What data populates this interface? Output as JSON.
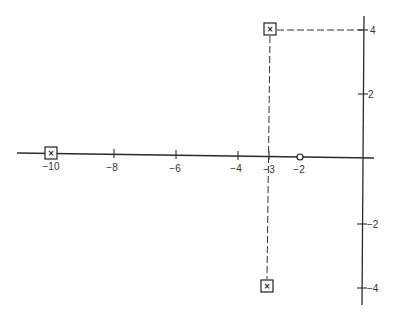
{
  "diagram": {
    "type": "pole-zero plot (s-plane)",
    "real_axis": {
      "ticks": [
        {
          "value": -10,
          "label": "−10"
        },
        {
          "value": -8,
          "label": "−8"
        },
        {
          "value": -6,
          "label": "−6"
        },
        {
          "value": -4,
          "label": "−4"
        },
        {
          "value": -3,
          "label": "−3"
        },
        {
          "value": -2,
          "label": "−2"
        }
      ]
    },
    "imag_axis": {
      "ticks": [
        {
          "value": 4,
          "label": "4"
        },
        {
          "value": 2,
          "label": "2"
        },
        {
          "value": -2,
          "label": "−2"
        },
        {
          "value": -4,
          "label": "−4"
        }
      ]
    },
    "poles": [
      {
        "re": -10,
        "im": 0,
        "marker": "×"
      },
      {
        "re": -3,
        "im": 4,
        "marker": "×"
      },
      {
        "re": -3,
        "im": -4,
        "marker": "×"
      }
    ],
    "zeros": [
      {
        "re": -2,
        "im": 0,
        "marker": "o"
      }
    ]
  }
}
